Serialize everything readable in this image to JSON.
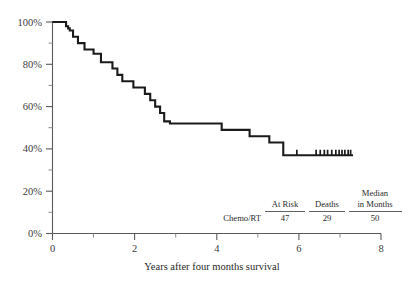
{
  "chart_data": {
    "type": "line",
    "title": "",
    "subtitle": "",
    "xlabel": "Years after four months survival",
    "ylabel": "",
    "xlim": [
      0,
      8
    ],
    "ylim": [
      0,
      100
    ],
    "grid": false,
    "legend_position": "none",
    "x_ticks": [
      0,
      2,
      4,
      6,
      8
    ],
    "x_tick_labels": [
      "0",
      "2",
      "4",
      "6",
      "8"
    ],
    "x_minor_ticks": [
      1,
      3,
      5,
      7
    ],
    "y_ticks": [
      0,
      20,
      40,
      60,
      80,
      100
    ],
    "y_tick_labels": [
      "0%",
      "20%",
      "40%",
      "60%",
      "80%",
      "100%"
    ],
    "y_minor_ticks": [
      10,
      30,
      50,
      70,
      90
    ],
    "series": [
      {
        "name": "Chemo/RT",
        "style": "step-post",
        "color": "#1b1b1b",
        "points": [
          [
            0.0,
            100
          ],
          [
            0.3,
            100
          ],
          [
            0.33,
            98
          ],
          [
            0.38,
            97
          ],
          [
            0.42,
            96
          ],
          [
            0.5,
            93
          ],
          [
            0.62,
            90
          ],
          [
            0.7,
            90
          ],
          [
            0.78,
            87
          ],
          [
            0.95,
            87
          ],
          [
            1.0,
            85
          ],
          [
            1.12,
            85
          ],
          [
            1.18,
            81
          ],
          [
            1.4,
            81
          ],
          [
            1.46,
            78
          ],
          [
            1.58,
            75
          ],
          [
            1.7,
            72
          ],
          [
            1.9,
            72
          ],
          [
            1.97,
            69
          ],
          [
            2.18,
            69
          ],
          [
            2.25,
            66
          ],
          [
            2.38,
            63
          ],
          [
            2.5,
            60
          ],
          [
            2.62,
            57
          ],
          [
            2.72,
            53
          ],
          [
            2.86,
            52
          ],
          [
            4.05,
            52
          ],
          [
            4.12,
            49
          ],
          [
            4.72,
            49
          ],
          [
            4.8,
            46
          ],
          [
            5.2,
            46
          ],
          [
            5.28,
            43
          ],
          [
            5.55,
            43
          ],
          [
            5.62,
            37
          ],
          [
            7.32,
            37
          ]
        ],
        "censor_marks": [
          5.95,
          6.42,
          6.52,
          6.62,
          6.7,
          6.8,
          6.9,
          6.98,
          7.05,
          7.12,
          7.2,
          7.26
        ]
      }
    ],
    "risk_table": {
      "columns": [
        "At Risk",
        "Deaths",
        "Median in Months"
      ],
      "column_header_lines": [
        [
          "At Risk"
        ],
        [
          "Deaths"
        ],
        [
          "Median",
          "in Months"
        ]
      ],
      "rows": [
        {
          "label": "Chemo/RT",
          "values": [
            "47",
            "29",
            "50"
          ]
        }
      ]
    }
  }
}
